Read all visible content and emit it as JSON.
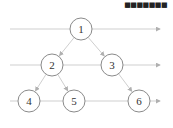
{
  "watermark": "■■■■■■■",
  "colors": {
    "line": "#cfcfcf",
    "node_stroke": "#8a8a8a",
    "arrow": "#b0b0b0",
    "text": "#333333"
  },
  "levels": [
    29,
    65,
    101
  ],
  "nodes": [
    {
      "id": "1",
      "label": "1",
      "x": 81,
      "y": 29
    },
    {
      "id": "2",
      "label": "2",
      "x": 52,
      "y": 65
    },
    {
      "id": "3",
      "label": "3",
      "x": 112,
      "y": 65
    },
    {
      "id": "4",
      "label": "4",
      "x": 29,
      "y": 101
    },
    {
      "id": "5",
      "label": "5",
      "x": 74,
      "y": 101
    },
    {
      "id": "6",
      "label": "6",
      "x": 139,
      "y": 101
    }
  ],
  "edges": [
    [
      "1",
      "2"
    ],
    [
      "1",
      "3"
    ],
    [
      "2",
      "4"
    ],
    [
      "2",
      "5"
    ],
    [
      "3",
      "6"
    ]
  ]
}
